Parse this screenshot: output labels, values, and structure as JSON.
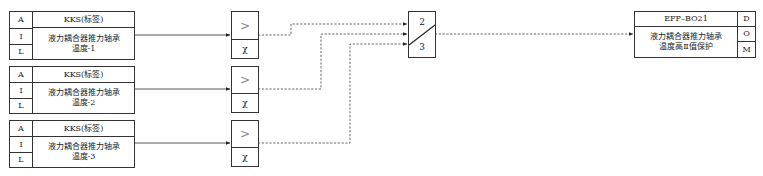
{
  "inputs": [
    {
      "a_label": "A",
      "i_label": "I",
      "l_label": "L",
      "tag": "KKS(标签)",
      "desc_line1": "液力耦合器推力轴承",
      "desc_line2": "温度-1"
    },
    {
      "a_label": "A",
      "i_label": "I",
      "l_label": "L",
      "tag": "KKS(标签)",
      "desc_line1": "液力耦合器推力轴承",
      "desc_line2": "温度-2"
    },
    {
      "a_label": "A",
      "i_label": "I",
      "l_label": "L",
      "tag": "KKS(标签)",
      "desc_line1": "液力耦合器推力轴承",
      "desc_line2": "温度-3"
    }
  ],
  "comparators": [
    {
      "op": ">",
      "param": "χ"
    },
    {
      "op": ">",
      "param": "χ"
    },
    {
      "op": ">",
      "param": "χ"
    }
  ],
  "selector": {
    "top_label": "2",
    "bottom_label": "3"
  },
  "output": {
    "tag": "EFP–BO21",
    "desc_line1": "液力耦合器推力轴承",
    "desc_line2": "温度高Ⅱ值保护",
    "d_label": "D",
    "o_label": "O",
    "m_label": "M"
  },
  "colors": {
    "line": "#333333",
    "dashed": "#555555",
    "comparator_symbol": "#888888"
  }
}
